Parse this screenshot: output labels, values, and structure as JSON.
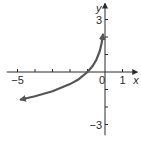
{
  "chart_data": {
    "type": "line",
    "title": "",
    "xlabel": "x",
    "ylabel": "y",
    "xlim": [
      -5.5,
      1.5
    ],
    "ylim": [
      -3.5,
      3.8
    ],
    "x_ticks": [
      -5,
      -4,
      -3,
      -2,
      -1,
      0,
      1
    ],
    "y_ticks": [
      -3,
      -2,
      -1,
      1,
      2,
      3
    ],
    "x_tick_labels": [
      {
        "value": -5,
        "label": "−5"
      },
      {
        "value": 0,
        "label": "0"
      },
      {
        "value": 1,
        "label": "1"
      }
    ],
    "y_tick_labels": [
      {
        "value": 3,
        "label": "3"
      },
      {
        "value": -3,
        "label": "−3"
      }
    ],
    "grid": false,
    "series": [
      {
        "name": "curve",
        "function": "y = -ln(-x)",
        "x": [
          -4.8,
          -4,
          -3,
          -2,
          -1.5,
          -1,
          -0.7,
          -0.5,
          -0.3,
          -0.2,
          -0.15,
          -0.12
        ],
        "y": [
          -1.57,
          -1.39,
          -1.1,
          -0.69,
          -0.41,
          0,
          0.36,
          0.69,
          1.2,
          1.61,
          1.9,
          2.12
        ],
        "left_end": "arrow",
        "right_end": "arrow",
        "color": "#555555"
      }
    ]
  }
}
